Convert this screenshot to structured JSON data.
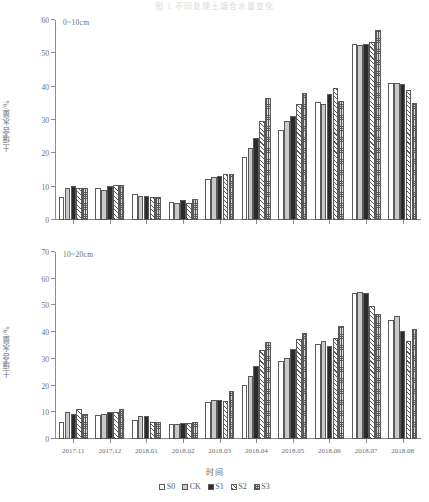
{
  "figure": {
    "title": "图 1   不同处理土壤含水量变化",
    "xaxis_title": "时间",
    "yaxis_title": "土壤含水量/%"
  },
  "legend": {
    "position": "bottom-center",
    "entries": [
      {
        "label": "S0",
        "pattern": "p-s0",
        "color": "#ffffff"
      },
      {
        "label": "CK",
        "pattern": "p-ck",
        "color": "#c9c9c9"
      },
      {
        "label": "S1",
        "pattern": "p-s1",
        "color": "#2b2b2b"
      },
      {
        "label": "S2",
        "pattern": "p-s2",
        "color": "#ffffff"
      },
      {
        "label": "S3",
        "pattern": "p-s3",
        "color": "#d8d8d8"
      }
    ]
  },
  "panels": [
    {
      "depth_label": "0~10cm",
      "ymin": 0,
      "ymax": 60,
      "ystep": 10,
      "yticks": [
        0,
        10,
        20,
        30,
        40,
        50,
        60
      ]
    },
    {
      "depth_label": "10~20cm",
      "ymin": 0,
      "ymax": 70,
      "ystep": 10,
      "yticks": [
        0,
        10,
        20,
        30,
        40,
        50,
        60,
        70
      ]
    }
  ],
  "chart_data": [
    {
      "type": "bar",
      "title": "0~10cm",
      "xlabel": "时间",
      "ylabel": "土壤含水量/%",
      "ylim": [
        0,
        60
      ],
      "grid": false,
      "legend_position": "bottom-center",
      "categories": [
        "2017.11",
        "2017.12",
        "2018.01",
        "2018.02",
        "2018.03",
        "2018.04",
        "2018.05",
        "2018.06",
        "2018.07",
        "2018.08"
      ],
      "series": [
        {
          "name": "S0",
          "values": [
            6.9,
            9.5,
            7.7,
            5.5,
            12.3,
            18.8,
            26.9,
            35.4,
            52.9,
            41.2
          ]
        },
        {
          "name": "CK",
          "values": [
            9.7,
            8.9,
            7.3,
            5.2,
            12.8,
            21.6,
            29.6,
            34.8,
            52.4,
            41.2
          ]
        },
        {
          "name": "S1",
          "values": [
            10.1,
            10.2,
            7.3,
            6.1,
            13.2,
            24.6,
            31.1,
            37.7,
            52.8,
            40.9
          ]
        },
        {
          "name": "S2",
          "values": [
            9.7,
            10.5,
            6.9,
            5.2,
            13.9,
            29.8,
            34.8,
            39.5,
            53.5,
            39.1
          ]
        },
        {
          "name": "S3",
          "values": [
            9.7,
            10.6,
            7.0,
            6.2,
            13.7,
            36.7,
            38.2,
            35.8,
            57.0,
            35.2
          ]
        }
      ]
    },
    {
      "type": "bar",
      "title": "10~20cm",
      "xlabel": "时间",
      "ylabel": "土壤含水量/%",
      "ylim": [
        0,
        70
      ],
      "grid": false,
      "legend_position": "bottom-center",
      "categories": [
        "2017.11",
        "2017.12",
        "2018.01",
        "2018.02",
        "2018.03",
        "2018.04",
        "2018.05",
        "2018.06",
        "2018.07",
        "2018.08"
      ],
      "series": [
        {
          "name": "S0",
          "values": [
            6.5,
            9.0,
            7.2,
            5.6,
            13.9,
            20.3,
            29.3,
            35.6,
            54.7,
            44.6
          ]
        },
        {
          "name": "CK",
          "values": [
            10.0,
            9.4,
            8.6,
            5.5,
            14.5,
            23.6,
            30.4,
            36.6,
            54.9,
            46.0
          ]
        },
        {
          "name": "S1",
          "values": [
            9.4,
            10.2,
            8.6,
            6.0,
            14.6,
            27.2,
            33.8,
            34.9,
            54.8,
            40.6
          ]
        },
        {
          "name": "S2",
          "values": [
            11.2,
            10.2,
            6.2,
            6.0,
            14.1,
            33.2,
            37.6,
            38.0,
            49.7,
            36.6
          ]
        },
        {
          "name": "S3",
          "values": [
            9.2,
            11.3,
            6.2,
            6.5,
            17.9,
            36.5,
            39.8,
            42.2,
            46.8,
            41.0
          ]
        }
      ]
    }
  ]
}
